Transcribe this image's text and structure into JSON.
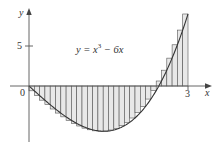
{
  "chart_data": {
    "type": "bar",
    "subtype": "riemann-sum-right-endpoints",
    "title": "",
    "function_label": "y = x^3 - 6x",
    "function_label_parts": {
      "lhs": "y = x",
      "exp": "3",
      "rhs": " − 6x"
    },
    "xlabel": "x",
    "ylabel": "y",
    "x_ticks": [
      {
        "value": 0,
        "label": "0"
      },
      {
        "value": 3,
        "label": "3"
      }
    ],
    "y_ticks": [
      {
        "value": 5,
        "label": "5"
      }
    ],
    "xlim": [
      0,
      3
    ],
    "ylim": [
      -6,
      10
    ],
    "n_rectangles": 30,
    "delta_x": 0.1,
    "sample_points": "right",
    "x": [
      0.1,
      0.2,
      0.3,
      0.4,
      0.5,
      0.6,
      0.7,
      0.8,
      0.9,
      1.0,
      1.1,
      1.2,
      1.3,
      1.4,
      1.5,
      1.6,
      1.7,
      1.8,
      1.9,
      2.0,
      2.1,
      2.2,
      2.3,
      2.4,
      2.5,
      2.6,
      2.7,
      2.8,
      2.9,
      3.0
    ],
    "values": [
      -0.599,
      -1.192,
      -1.773,
      -2.336,
      -2.875,
      -3.384,
      -3.857,
      -4.288,
      -4.671,
      -5.0,
      -5.269,
      -5.472,
      -5.603,
      -5.656,
      -5.625,
      -5.504,
      -5.287,
      -4.968,
      -4.541,
      -4.0,
      -3.339,
      -2.552,
      -1.633,
      -0.576,
      0.625,
      1.976,
      3.483,
      5.152,
      6.989,
      9.0
    ],
    "grid": false,
    "legend": null
  },
  "axis_labels": {
    "x": "x",
    "y": "y",
    "origin": "0",
    "x_tick_3": "3",
    "y_tick_5": "5"
  },
  "colors": {
    "axis": "#555555",
    "curve": "#333333",
    "bar_edge": "#555555",
    "bar_fill": "#e8e8e8"
  }
}
